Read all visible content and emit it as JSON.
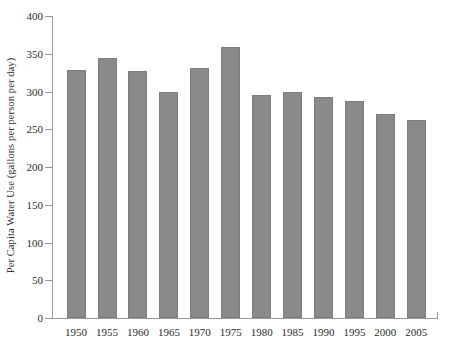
{
  "chart_data": {
    "type": "bar",
    "title": "",
    "subtitle": "",
    "xlabel": "",
    "ylabel": "Per Capita Water Use (gallons per person per day)",
    "categories": [
      "1950",
      "1955",
      "1960",
      "1965",
      "1970",
      "1975",
      "1980",
      "1985",
      "1990",
      "1995",
      "2000",
      "2005"
    ],
    "values": [
      328,
      345,
      327,
      299,
      331,
      359,
      295,
      300,
      293,
      288,
      270,
      262
    ],
    "ylim": [
      0,
      400
    ],
    "ytick_values": [
      0,
      50,
      100,
      150,
      200,
      250,
      300,
      350,
      400
    ],
    "ytick_labels": [
      "0",
      "50",
      "100",
      "150",
      "200",
      "250",
      "300",
      "350",
      "400"
    ],
    "grid": false,
    "legend": null,
    "bar_color": "#8a8a8a",
    "bar_edge_color": "#7d7d7d",
    "background_color": "#ffffff",
    "axis_color": "#9a9a9a"
  }
}
